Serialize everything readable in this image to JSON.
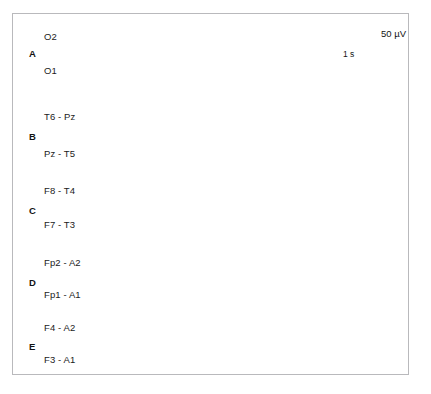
{
  "figure": {
    "kind": "eeg-multichannel-recording",
    "background_color": "#ffffff",
    "frame_color": "#b9b9bc",
    "trace_color": "#1a1a1a",
    "width": 431,
    "height": 394
  },
  "scale_bars": {
    "amplitude": {
      "label": "50 µV",
      "value": 50,
      "unit": "µV",
      "bracket_orientation": "vertical-left",
      "x": 372,
      "y_top": 25,
      "y_bottom": 43,
      "text_x": 381,
      "text_y": 28
    },
    "time": {
      "label": "1 s",
      "value": 1,
      "unit": "s",
      "bracket_orientation": "horizontal-top",
      "x_left": 326,
      "x_right": 381,
      "y": 47,
      "tick_height": 6,
      "text_x": 343,
      "text_y": 49
    }
  },
  "trace_geometry": {
    "x_start": 88,
    "x_end": 371,
    "samples": 560
  },
  "groups": [
    {
      "letter": "A",
      "letter_x": 29,
      "letter_y": 48,
      "channels": [
        {
          "label": "O2",
          "label_x": 44,
          "label_y": 31,
          "baseline_y": 39,
          "x_end": 371,
          "wave": {
            "base_amp": 2.0,
            "base_freq": 34,
            "burst": {
              "start": 0.34,
              "end": 1.0,
              "amp": 5.2,
              "freq": 44,
              "ramp": 0.25
            },
            "slow_amp": 1.6,
            "slow_freq": 2.4,
            "noise": 0.7,
            "seed": 11
          }
        },
        {
          "label": "O1",
          "label_x": 44,
          "label_y": 65,
          "baseline_y": 73,
          "x_end": 371,
          "wave": {
            "base_amp": 2.2,
            "base_freq": 30,
            "burst": {
              "start": 0.28,
              "end": 0.96,
              "amp": 8.5,
              "freq": 40,
              "ramp": 0.3
            },
            "slow_amp": 1.8,
            "slow_freq": 2.0,
            "noise": 0.8,
            "seed": 23
          }
        }
      ]
    },
    {
      "letter": "B",
      "letter_x": 29,
      "letter_y": 131,
      "channels": [
        {
          "label": "T6 - Pz",
          "label_x": 44,
          "label_y": 111,
          "baseline_y": 119,
          "x_end": 371,
          "wave": {
            "base_amp": 2.4,
            "base_freq": 36,
            "burst": {
              "start": 0.06,
              "end": 0.72,
              "amp": 4.4,
              "freq": 46,
              "ramp": 0.2
            },
            "slow_amp": 1.5,
            "slow_freq": 2.6,
            "noise": 0.7,
            "seed": 37
          }
        },
        {
          "label": "Pz - T5",
          "label_x": 44,
          "label_y": 148,
          "baseline_y": 156,
          "x_end": 371,
          "wave": {
            "base_amp": 2.6,
            "base_freq": 32,
            "burst": {
              "start": 0.02,
              "end": 0.68,
              "amp": 9.5,
              "freq": 42,
              "ramp": 0.18
            },
            "slow_amp": 1.7,
            "slow_freq": 2.2,
            "noise": 0.8,
            "seed": 53
          }
        }
      ]
    },
    {
      "letter": "C",
      "letter_x": 29,
      "letter_y": 205,
      "channels": [
        {
          "label": "F8 - T4",
          "label_x": 44,
          "label_y": 185,
          "baseline_y": 193,
          "x_end": 371,
          "wave": {
            "base_amp": 1.8,
            "base_freq": 40,
            "burst": null,
            "slow_amp": 2.2,
            "slow_freq": 3.0,
            "noise": 0.8,
            "seed": 71
          }
        },
        {
          "label": "F7 - T3",
          "label_x": 44,
          "label_y": 219,
          "baseline_y": 227,
          "x_end": 371,
          "wave": {
            "base_amp": 1.1,
            "base_freq": 46,
            "burst": null,
            "slow_amp": 1.0,
            "slow_freq": 2.4,
            "noise": 0.6,
            "seed": 89
          }
        }
      ]
    },
    {
      "letter": "D",
      "letter_x": 29,
      "letter_y": 277,
      "channels": [
        {
          "label": "Fp2 - A2",
          "label_x": 44,
          "label_y": 257,
          "baseline_y": 264,
          "x_end": 371,
          "wave": {
            "base_amp": 3.4,
            "base_freq": 52,
            "burst": null,
            "slow_amp": 8.5,
            "slow_freq": 7.0,
            "noise": 1.4,
            "seed": 101
          }
        },
        {
          "label": "Fp1 - A1",
          "label_x": 44,
          "label_y": 289,
          "baseline_y": 294,
          "x_end": 371,
          "wave": {
            "base_amp": 3.0,
            "base_freq": 48,
            "burst": null,
            "slow_amp": 11.0,
            "slow_freq": 6.0,
            "noise": 1.5,
            "seed": 127
          }
        }
      ]
    },
    {
      "letter": "E",
      "letter_x": 29,
      "letter_y": 341,
      "channels": [
        {
          "label": "F4 - A2",
          "label_x": 44,
          "label_y": 322,
          "baseline_y": 330,
          "x_end": 371,
          "wave": {
            "base_amp": 6.5,
            "base_freq": 120,
            "burst": null,
            "slow_amp": 3.0,
            "slow_freq": 5.0,
            "noise": 2.6,
            "seed": 149
          }
        },
        {
          "label": "F3 - A1",
          "label_x": 44,
          "label_y": 354,
          "baseline_y": 361,
          "x_end": 371,
          "wave": {
            "base_amp": 1.3,
            "base_freq": 50,
            "burst": null,
            "slow_amp": 1.0,
            "slow_freq": 3.2,
            "noise": 0.7,
            "seed": 163
          }
        }
      ]
    }
  ]
}
